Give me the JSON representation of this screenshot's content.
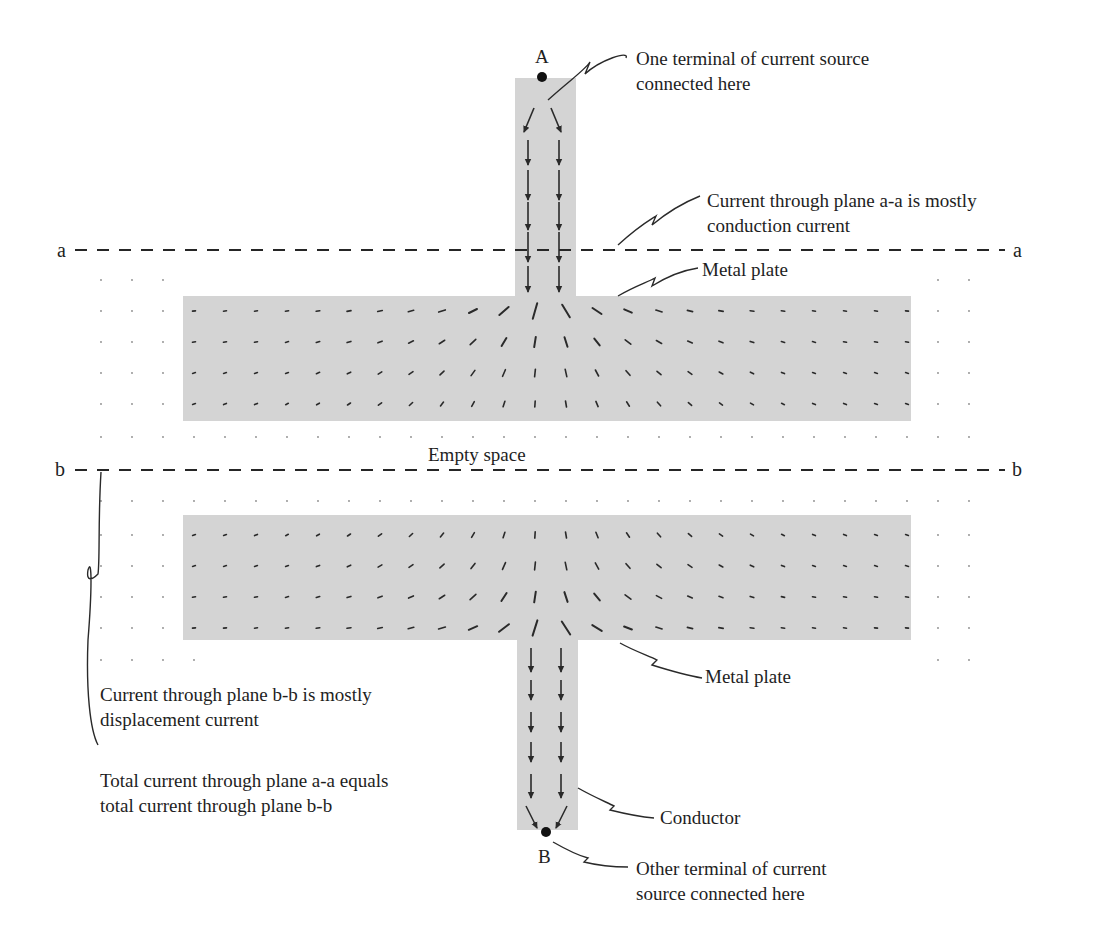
{
  "figure": {
    "terminals": {
      "A": {
        "label": "A",
        "x": 542,
        "y": 77
      },
      "B": {
        "label": "B",
        "x": 546,
        "y": 832
      }
    },
    "planes": {
      "a": {
        "label_left": "a",
        "label_right": "a",
        "y": 250,
        "x1": 75,
        "x2": 1005
      },
      "b": {
        "label_left": "b",
        "label_right": "b",
        "y": 470,
        "x1": 75,
        "x2": 1005
      }
    },
    "regions": {
      "top_connector": {
        "x": 515,
        "y": 78,
        "w": 61,
        "h": 220
      },
      "top_plate": {
        "x": 183,
        "y": 296,
        "w": 728,
        "h": 125
      },
      "bottom_plate": {
        "x": 183,
        "y": 515,
        "w": 728,
        "h": 125
      },
      "bottom_connector": {
        "x": 517,
        "y": 638,
        "w": 61,
        "h": 192
      }
    },
    "colors": {
      "metal_fill": "#d4d4d4",
      "arrow": "#2a2a2a",
      "dash": "#262626",
      "text": "#1e1e1e"
    },
    "empty_space_label": "Empty space"
  },
  "annotations": {
    "terminal_a_note": {
      "line1": "One terminal of current source",
      "line2": "connected here"
    },
    "plane_a_note": {
      "line1": "Current through plane a-a is mostly",
      "line2": "conduction current"
    },
    "top_plate_note": {
      "line1": "Metal plate"
    },
    "plane_b_note": {
      "line1": "Current through plane b-b is mostly",
      "line2": "displacement current"
    },
    "total_current_note": {
      "line1": "Total current through plane a-a equals",
      "line2": "total current through plane b-b"
    },
    "bottom_plate_note": {
      "line1": "Metal plate"
    },
    "conductor_note": {
      "line1": "Conductor"
    },
    "terminal_b_note": {
      "line1": "Other terminal of current",
      "line2": "source connected here"
    }
  }
}
